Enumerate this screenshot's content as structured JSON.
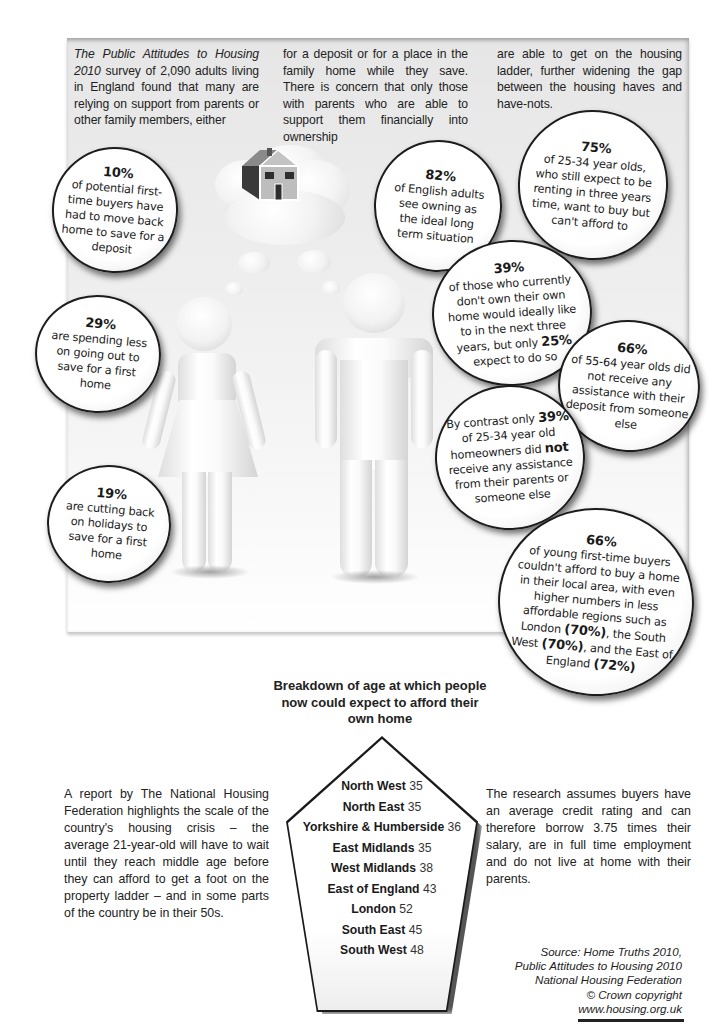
{
  "intro": {
    "col1_title_italic": "The Public Attitudes to Housing 2010",
    "col1_rest": " survey of 2,090 adults living in England found that many are relying on support from parents or other family members, either",
    "col2": "for a deposit or for a place in the family home while they save. There is concern that only those with parents who are able to support them financially into ownership",
    "col3": "are able to get on the housing ladder, further widening the gap between the housing haves and have-nots."
  },
  "bubbles": {
    "b10": {
      "pct": "10%",
      "text": "of potential first-time buyers have had to move back home to save for a deposit"
    },
    "b82": {
      "pct": "82%",
      "text": "of English adults see owning as the ideal long term situation"
    },
    "b75": {
      "pct": "75%",
      "text": "of 25-34 year olds, who still expect to be renting in three years time, want to buy but can't afford to"
    },
    "b39a": {
      "pct": "39%",
      "text_before": "of those who currently don't own their own home would ideally like to in the next three years, but only ",
      "bold": "25%",
      "text_after": " expect to do so"
    },
    "b29": {
      "pct": "29%",
      "text": "are spending less on going out to save for a first home"
    },
    "b66a": {
      "pct": "66%",
      "text": "of 55-64 year olds did not receive any assistance with their deposit from someone else"
    },
    "b39b": {
      "text_before": "By contrast only ",
      "bold1": "39%",
      "text_mid": " of 25-34 year old homeowners did ",
      "bold2": "not",
      "text_after": " receive any assistance from their parents or someone else"
    },
    "b19": {
      "pct": "19%",
      "text": "are cutting back on holidays to save for a first home"
    },
    "b66b": {
      "pct": "66%",
      "text1": "of young first-time buyers couldn't afford to buy a home in their local area, with even higher numbers in less affordable regions such as London ",
      "bold1": "(70%)",
      "text2": ", the South West ",
      "bold2": "(70%)",
      "text3": ", and the East of England ",
      "bold3": "(72%)"
    }
  },
  "breakdown": {
    "title": "Breakdown of age at which people now could expect to afford their own home",
    "regions": [
      {
        "name": "North West",
        "age": "35"
      },
      {
        "name": "North East",
        "age": "35"
      },
      {
        "name": "Yorkshire & Humberside",
        "age": "36"
      },
      {
        "name": "East Midlands",
        "age": "35"
      },
      {
        "name": "West Midlands",
        "age": "38"
      },
      {
        "name": "East of England",
        "age": "43"
      },
      {
        "name": "London",
        "age": "52"
      },
      {
        "name": "South East",
        "age": "45"
      },
      {
        "name": "South West",
        "age": "48"
      }
    ]
  },
  "left_text": "A report by The National Housing Federation highlights the scale of the country's housing crisis – the average 21-year-old will have to wait until they reach middle age before they can afford to get a foot on the property ladder – and in some parts of the country be in their 50s.",
  "right_text": "The research assumes buyers have an average credit rating and can therefore borrow 3.75 times their salary, are in full time employment and do not live at home with their parents.",
  "source": {
    "line1": "Source: Home Truths 2010,",
    "line2": "Public Attitudes to Housing 2010",
    "line3": "National Housing Federation",
    "line4": "© Crown copyright",
    "line5": "www.housing.org.uk"
  }
}
